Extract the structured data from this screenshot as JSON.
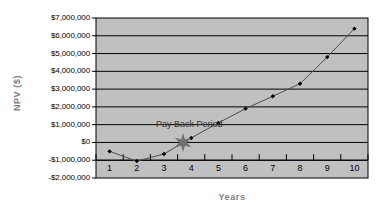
{
  "chart_data": {
    "type": "line",
    "title": "",
    "xlabel": "Years",
    "ylabel": "NPV ($)",
    "x": [
      1,
      2,
      3,
      4,
      5,
      6,
      7,
      8,
      9,
      10
    ],
    "values": [
      -500000,
      -1050000,
      -650000,
      250000,
      1100000,
      1900000,
      2600000,
      3300000,
      4800000,
      6400000
    ],
    "series": [
      {
        "name": "NPV",
        "values": [
          -500000,
          -1050000,
          -650000,
          250000,
          1100000,
          1900000,
          2600000,
          3300000,
          4800000,
          6400000
        ]
      }
    ],
    "categories": [
      "1",
      "2",
      "3",
      "4",
      "5",
      "6",
      "7",
      "8",
      "9",
      "10"
    ],
    "xtick_labels": [
      "1",
      "2",
      "3",
      "4",
      "5",
      "6",
      "7",
      "8",
      "9",
      "10"
    ],
    "ytick_labels": [
      "$7,000,000",
      "$6,000,000",
      "$5,000,000",
      "$4,000,000",
      "$3,000,000",
      "$2,000,000",
      "$1,000,000",
      "$0",
      "-$1,000,000",
      "-$2,000,000"
    ],
    "ytick_values": [
      7000000,
      6000000,
      5000000,
      4000000,
      3000000,
      2000000,
      1000000,
      0,
      -1000000,
      -2000000
    ],
    "ylim": [
      -2000000,
      7000000
    ],
    "xlim": [
      0.5,
      10.5
    ],
    "grid": true,
    "legend": "none",
    "annotations": [
      {
        "text": "Pay Back Period",
        "x": 3.0,
        "y": 1000000
      },
      {
        "marker": "star",
        "label": "payback-point",
        "x": 3.7,
        "y": 0
      }
    ],
    "colors": {
      "plot_background": "#c0c0c0",
      "gridline": "#000000",
      "line": "#4d4d4d",
      "marker": "#000000",
      "star": "#707070",
      "axis_label": "#808080",
      "tick_label": "#000000",
      "page_background": "#ffffff"
    }
  }
}
